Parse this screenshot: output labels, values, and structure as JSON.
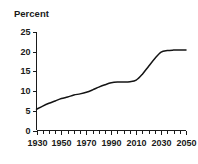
{
  "chart_data": {
    "type": "line",
    "title": "Percent",
    "xlabel": "",
    "ylabel": "",
    "grid": false,
    "legend": null,
    "xlim": [
      1930,
      2050
    ],
    "ylim": [
      0,
      25
    ],
    "y_ticks": [
      0,
      5,
      10,
      15,
      20,
      25
    ],
    "y_tick_labels": [
      "0",
      "5",
      "10",
      "15",
      "20",
      "25"
    ],
    "x_major_ticks": [
      1930,
      1950,
      1970,
      1990,
      2010,
      2030,
      2050
    ],
    "x_tick_labels": [
      "1930",
      "1950",
      "1970",
      "1990",
      "2010",
      "2030",
      "2050"
    ],
    "x_minor_tick_step": 5,
    "line_color": "#141414",
    "series": [
      {
        "name": "Percent",
        "x": [
          1930,
          1935,
          1940,
          1945,
          1950,
          1955,
          1960,
          1965,
          1970,
          1975,
          1980,
          1985,
          1990,
          1995,
          2000,
          2005,
          2010,
          2015,
          2020,
          2025,
          2030,
          2035,
          2040,
          2045,
          2050
        ],
        "values": [
          5.4,
          6.2,
          6.9,
          7.5,
          8.1,
          8.5,
          9.0,
          9.3,
          9.7,
          10.3,
          11.0,
          11.6,
          12.1,
          12.3,
          12.3,
          12.4,
          12.8,
          14.3,
          16.3,
          18.3,
          19.9,
          20.3,
          20.4,
          20.4,
          20.4
        ]
      }
    ]
  },
  "axis": {
    "title": "Percent"
  }
}
